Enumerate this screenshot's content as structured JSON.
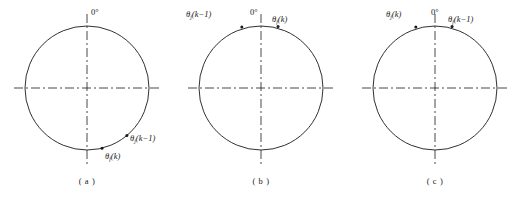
{
  "figure": {
    "type": "diagram",
    "stroke_color": "#1a1a1a",
    "background_color": "#ffffff"
  },
  "panels": [
    {
      "caption": "( a )",
      "zero_label": "0°",
      "labels": [
        {
          "theta": "θ",
          "sub": "j",
          "arg": "(k−1)",
          "full": "θj(k−1)"
        },
        {
          "theta": "θ",
          "sub": "f",
          "arg": "(k)",
          "full": "θf(k)"
        }
      ],
      "points": [
        {
          "name": "theta-j-k-1",
          "angle_deg": 140
        },
        {
          "name": "theta-f-k",
          "angle_deg": 166
        }
      ]
    },
    {
      "caption": "( b )",
      "zero_label": "0°",
      "labels": [
        {
          "theta": "θ",
          "sub": "j",
          "arg": "(k−1)",
          "full": "θj(k−1)"
        },
        {
          "theta": "θ",
          "sub": "f",
          "arg": "(k)",
          "full": "θf(k)"
        }
      ],
      "points": [
        {
          "name": "theta-j-k-1",
          "angle_deg": -18
        },
        {
          "name": "theta-f-k",
          "angle_deg": 16
        }
      ]
    },
    {
      "caption": "( c )",
      "zero_label": "0°",
      "labels": [
        {
          "theta": "θ",
          "sub": "j",
          "arg": "(k)",
          "full": "θj(k)"
        },
        {
          "theta": "θ",
          "sub": "f",
          "arg": "(k−1)",
          "full": "θf(k−1)"
        }
      ],
      "points": [
        {
          "name": "theta-j-k",
          "angle_deg": -18
        },
        {
          "name": "theta-f-k-1",
          "angle_deg": 16
        }
      ]
    }
  ]
}
